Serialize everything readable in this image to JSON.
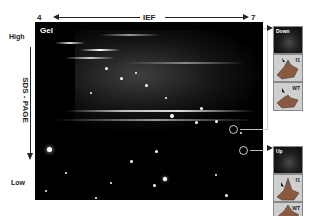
{
  "figure": {
    "axis_top": {
      "left_label": "4",
      "center_label": "IEF",
      "right_label": "7"
    },
    "axis_left": {
      "top_label": "High",
      "center_label": "SDS - PAGE",
      "bottom_label": "Low"
    },
    "gel": {
      "label": "Gel"
    },
    "insets": {
      "down": {
        "label": "Down",
        "mesh_top": "f1",
        "mesh_bottom": "WT"
      },
      "up": {
        "label": "Up",
        "mesh_top": "f1",
        "mesh_bottom": "WT"
      }
    }
  },
  "colors": {
    "gel_bg": "#000000",
    "spot": "#ffffff",
    "mesh_bg": "#cfcfcf",
    "mesh_surface": "#8a5a40",
    "axis": "#222222"
  }
}
